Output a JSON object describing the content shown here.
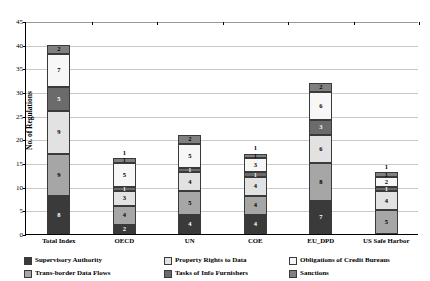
{
  "chart_data": {
    "type": "bar",
    "title": "",
    "subtitle": "",
    "xlabel": "",
    "ylabel": "No. of Regulations",
    "ylim": [
      0,
      45
    ],
    "yticks": [
      0,
      5,
      10,
      15,
      20,
      25,
      30,
      35,
      40,
      45
    ],
    "grid": true,
    "stacked": true,
    "legend_position": "bottom",
    "categories": [
      "Total Index",
      "OECD",
      "UN",
      "COE",
      "EU_DPD",
      "US Safe Harbor"
    ],
    "series": [
      {
        "name": "Supervisory Authority",
        "color": "#3a3a3a",
        "values": [
          8,
          2,
          4,
          4,
          7,
          0
        ]
      },
      {
        "name": "Trans-border Data Flows",
        "color": "#a6a6a6",
        "values": [
          9,
          4,
          5,
          4,
          8,
          5
        ]
      },
      {
        "name": "Property Rights to Data",
        "color": "#e2e2e2",
        "values": [
          9,
          3,
          4,
          4,
          6,
          4
        ]
      },
      {
        "name": "Tasks of Info Furnishers",
        "color": "#6b6b6b",
        "values": [
          5,
          1,
          1,
          1,
          3,
          1
        ]
      },
      {
        "name": "Obligations of Credit Bureaus",
        "color": "#f7f7f7",
        "values": [
          7,
          5,
          5,
          3,
          6,
          2
        ]
      },
      {
        "name": "Sanctions",
        "color": "#808080",
        "values": [
          2,
          1,
          2,
          1,
          2,
          1
        ]
      }
    ],
    "totals": [
      40,
      16,
      21,
      17,
      32,
      13
    ]
  },
  "yaxis": {
    "label": "No. of Regulations",
    "ticks": [
      "0",
      "5",
      "10",
      "15",
      "20",
      "25",
      "30",
      "35",
      "40",
      "45"
    ]
  },
  "xaxis": {
    "ticks": [
      "Total Index",
      "OECD",
      "UN",
      "COE",
      "EU_DPD",
      "US Safe Harbor"
    ]
  },
  "legend": {
    "items": [
      {
        "label": "Supervisory Authority"
      },
      {
        "label": "Property Rights to Data"
      },
      {
        "label": "Obligations of Credit Bureaus"
      },
      {
        "label": "Trans-border Data Flows"
      },
      {
        "label": "Tasks of Info Furnishers"
      },
      {
        "label": "Sanctions"
      }
    ]
  }
}
